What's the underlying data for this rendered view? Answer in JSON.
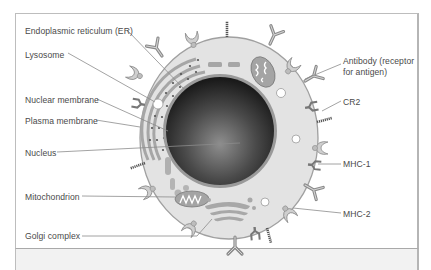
{
  "figure": {
    "labels_left": [
      {
        "id": "er",
        "text": "Endoplasmic reticulum (ER)",
        "x": 25,
        "y": 26
      },
      {
        "id": "lysosome",
        "text": "Lysosome",
        "x": 25,
        "y": 50
      },
      {
        "id": "nuclear-membrane",
        "text": "Nuclear membrane",
        "x": 25,
        "y": 95
      },
      {
        "id": "plasma-membrane",
        "text": "Plasma membrane",
        "x": 25,
        "y": 117
      },
      {
        "id": "nucleus",
        "text": "Nucleus",
        "x": 25,
        "y": 149
      },
      {
        "id": "mitochondrion",
        "text": "Mitochondrion",
        "x": 25,
        "y": 193
      },
      {
        "id": "golgi",
        "text": "Golgi complex",
        "x": 25,
        "y": 232
      }
    ],
    "labels_right": [
      {
        "id": "antibody-line1",
        "text": "Antibody (receptor",
        "x": 343,
        "y": 57
      },
      {
        "id": "antibody-line2",
        "text": "for antigen)",
        "x": 343,
        "y": 68
      },
      {
        "id": "cr2",
        "text": "CR2",
        "x": 343,
        "y": 98
      },
      {
        "id": "mhc1",
        "text": "MHC-1",
        "x": 343,
        "y": 160
      },
      {
        "id": "mhc2",
        "text": "MHC-2",
        "x": 343,
        "y": 210
      }
    ]
  },
  "colors": {
    "cytoplasm": "#e3e3e3",
    "membrane": "#9a9a9a",
    "nucleus_dark": "#1e1e1e",
    "nucleus_light": "#8a8a8a",
    "organelle": "#a8a8a8",
    "leader_line": "#8c8c8c",
    "text": "#4a4a4a",
    "frame": "#bdbdbd"
  }
}
